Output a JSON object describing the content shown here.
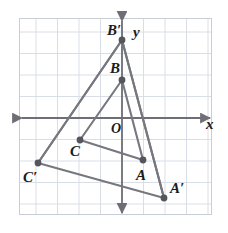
{
  "figure": {
    "title": "",
    "type": "coordinate-geometry-diagram",
    "colors": {
      "background": "#ffffff",
      "plot_background": "#ffffff",
      "grid": "#d9dee6",
      "plot_border": "#c9ced6",
      "axis": "#6e6e76",
      "segment": "#77777f",
      "point": "#55555d",
      "label": "#1b1b1b"
    },
    "plot_area": {
      "x": 19,
      "y": 18,
      "width": 193,
      "height": 197
    },
    "grid": {
      "spacing": 21.5,
      "visible": true
    },
    "axes": {
      "x_axis": {
        "label": "x",
        "y": 118,
        "arrows": "both",
        "label_x": 206,
        "label_y": 129
      },
      "y_axis": {
        "label": "y",
        "x": 122,
        "arrows": "both",
        "label_x": 133,
        "label_y": 37
      },
      "origin": {
        "label": "O",
        "x": 111,
        "y": 133
      }
    },
    "points": [
      {
        "name": "B-prime",
        "label": "B′",
        "x": 122,
        "y": 40,
        "label_x": 107,
        "label_y": 35
      },
      {
        "name": "B",
        "label": "B",
        "x": 122,
        "y": 80,
        "label_x": 110,
        "label_y": 73
      },
      {
        "name": "C",
        "label": "C",
        "x": 80,
        "y": 140,
        "label_x": 70,
        "label_y": 156
      },
      {
        "name": "A",
        "label": "A",
        "x": 143,
        "y": 160,
        "label_x": 136,
        "label_y": 180
      },
      {
        "name": "C-prime",
        "label": "C′",
        "x": 38,
        "y": 163,
        "label_x": 23,
        "label_y": 182
      },
      {
        "name": "A-prime",
        "label": "A′",
        "x": 164,
        "y": 198,
        "label_x": 170,
        "label_y": 193
      }
    ],
    "triangles": [
      {
        "name": "triangle-ABC",
        "vertices": [
          "A",
          "B",
          "C"
        ]
      },
      {
        "name": "triangle-A-B-C-prime",
        "vertices": [
          "A-prime",
          "B-prime",
          "C-prime"
        ]
      }
    ],
    "rays": [
      {
        "name": "ray-through-A",
        "from": "B-prime",
        "to": "A-prime"
      },
      {
        "name": "ray-through-C",
        "from": "B-prime",
        "to": "C-prime"
      }
    ]
  }
}
